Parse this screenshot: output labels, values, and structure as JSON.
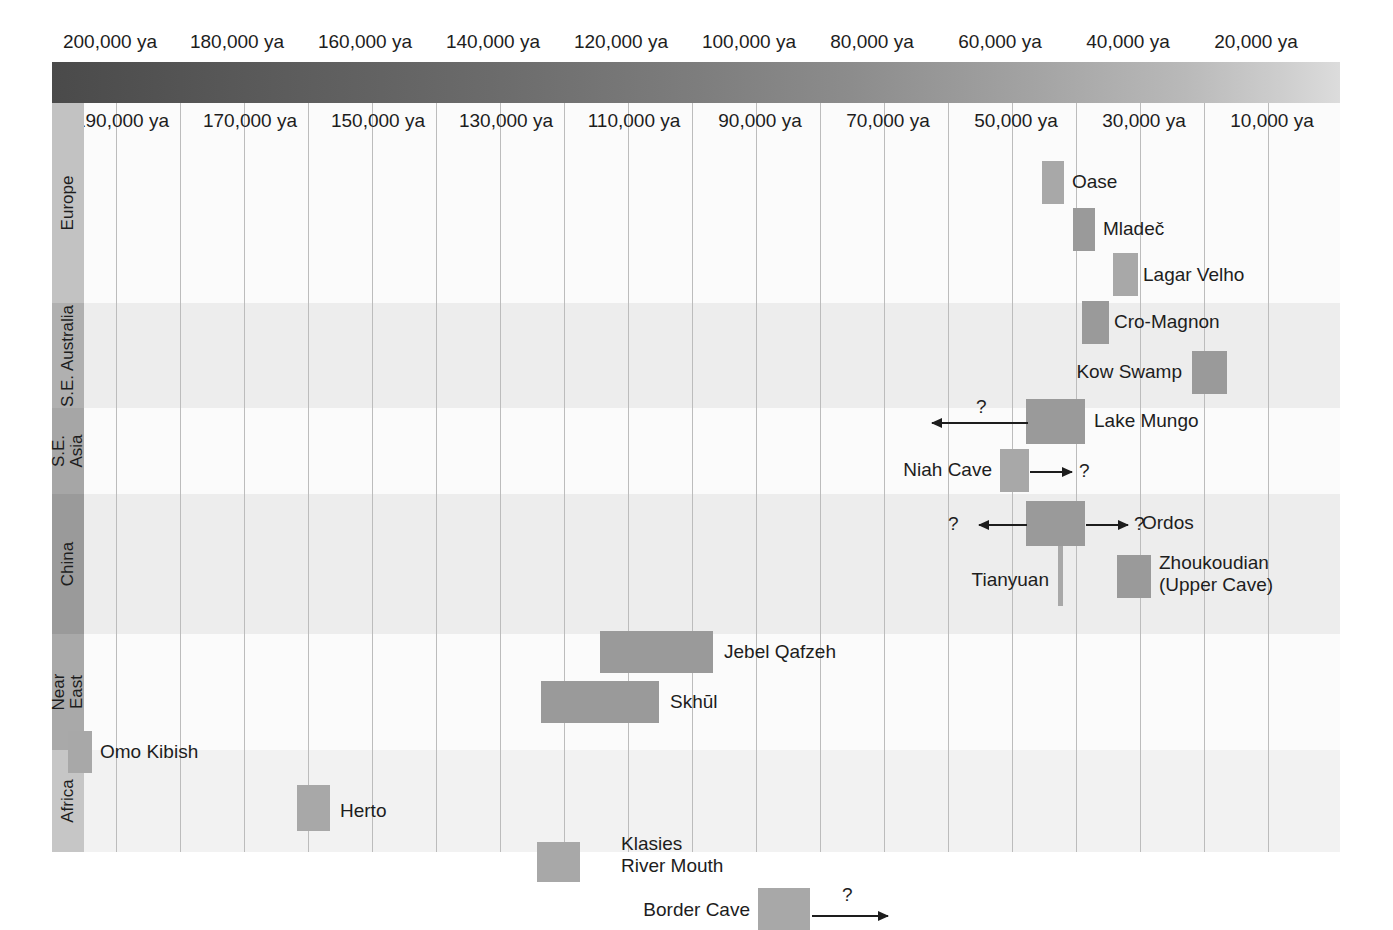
{
  "chart_data": {
    "type": "bar",
    "orientation": "horizontal-range",
    "xlabel": "Years ago",
    "ylabel": "Region",
    "xlim": [
      205000,
      0
    ],
    "x_axis_direction": "older-to-younger (left to right)",
    "grid": true,
    "legend": "none",
    "top_tick_labels": [
      {
        "label": "200,000 ya",
        "value": 200000
      },
      {
        "label": "180,000 ya",
        "value": 180000
      },
      {
        "label": "160,000 ya",
        "value": 160000
      },
      {
        "label": "140,000 ya",
        "value": 140000
      },
      {
        "label": "120,000 ya",
        "value": 120000
      },
      {
        "label": "100,000 ya",
        "value": 100000
      },
      {
        "label": "80,000 ya",
        "value": 80000
      },
      {
        "label": "60,000 ya",
        "value": 60000
      },
      {
        "label": "40,000 ya",
        "value": 40000
      },
      {
        "label": "20,000 ya",
        "value": 20000
      }
    ],
    "sub_tick_labels": [
      {
        "label": "190,000 ya",
        "value": 190000
      },
      {
        "label": "170,000 ya",
        "value": 170000
      },
      {
        "label": "150,000 ya",
        "value": 150000
      },
      {
        "label": "130,000 ya",
        "value": 130000
      },
      {
        "label": "110,000 ya",
        "value": 110000
      },
      {
        "label": "90,000 ya",
        "value": 90000
      },
      {
        "label": "70,000 ya",
        "value": 70000
      },
      {
        "label": "50,000 ya",
        "value": 50000
      },
      {
        "label": "30,000 ya",
        "value": 30000
      },
      {
        "label": "10,000 ya",
        "value": 10000
      }
    ],
    "gridline_values": [
      200000,
      190000,
      180000,
      170000,
      160000,
      150000,
      140000,
      130000,
      120000,
      110000,
      100000,
      90000,
      80000,
      70000,
      60000,
      50000,
      40000,
      30000,
      20000,
      10000
    ],
    "regions": [
      {
        "name": "Europe",
        "label": "Europe",
        "sites": [
          "Oase",
          "Mladeč",
          "Lagar Velho",
          "Cro-Magnon"
        ]
      },
      {
        "name": "SE Australia",
        "label": "S.E. Australia",
        "sites": [
          "Kow Swamp",
          "Lake Mungo"
        ]
      },
      {
        "name": "SE Asia",
        "label": "S.E. Asia",
        "sites": [
          "Niah Cave"
        ]
      },
      {
        "name": "China",
        "label": "China",
        "sites": [
          "Ordos",
          "Tianyuan",
          "Zhoukoudian (Upper Cave)"
        ]
      },
      {
        "name": "Near East",
        "label": "Near East",
        "sites": [
          "Jebel Qafzeh",
          "Skhūl"
        ]
      },
      {
        "name": "Africa",
        "label": "Africa",
        "sites": [
          "Omo Kibish",
          "Herto",
          "Klasies River Mouth",
          "Border Cave"
        ]
      }
    ],
    "sites": [
      {
        "name": "Oase",
        "region": "Europe",
        "start_ya": 41000,
        "end_ya": 37500,
        "label_side": "right",
        "uncertain": false
      },
      {
        "name": "Mladeč",
        "region": "Europe",
        "start_ya": 36500,
        "end_ya": 33500,
        "label_side": "right",
        "uncertain": false
      },
      {
        "name": "Lagar Velho",
        "region": "Europe",
        "start_ya": 30500,
        "end_ya": 27500,
        "label_side": "right",
        "uncertain": false
      },
      {
        "name": "Cro-Magnon",
        "region": "Europe",
        "start_ya": 33500,
        "end_ya": 30000,
        "label_side": "right",
        "uncertain": false
      },
      {
        "name": "Kow Swamp",
        "region": "SE Australia",
        "start_ya": 15500,
        "end_ya": 10500,
        "label_side": "left",
        "uncertain": false
      },
      {
        "name": "Lake Mungo",
        "region": "SE Australia",
        "start_ya": 43500,
        "end_ya": 34500,
        "label_side": "right",
        "uncertain": true,
        "arrow": "left",
        "arrow_qmark": "?"
      },
      {
        "name": "Niah Cave",
        "region": "SE Asia",
        "start_ya": 46000,
        "end_ya": 42000,
        "label_side": "left",
        "uncertain": true,
        "arrow": "right",
        "arrow_qmark": "?"
      },
      {
        "name": "Ordos",
        "region": "China",
        "start_ya": 43500,
        "end_ya": 34500,
        "label_side": "right",
        "uncertain": true,
        "arrow": "both",
        "arrow_qmark": "?"
      },
      {
        "name": "Tianyuan",
        "region": "China",
        "start_ya": 40500,
        "end_ya": 40000,
        "label_side": "left",
        "uncertain": false
      },
      {
        "name": "Zhoukoudian\n(Upper Cave)",
        "region": "China",
        "start_ya": 30500,
        "end_ya": 26500,
        "label_side": "right",
        "uncertain": false
      },
      {
        "name": "Jebel Qafzeh",
        "region": "Near East",
        "start_ya": 107000,
        "end_ya": 92000,
        "label_side": "right",
        "uncertain": false
      },
      {
        "name": "Skhūl",
        "region": "Near East",
        "start_ya": 113000,
        "end_ya": 99500,
        "label_side": "right",
        "uncertain": false
      },
      {
        "name": "Omo Kibish",
        "region": "Africa",
        "start_ya": 196500,
        "end_ya": 192500,
        "label_side": "right",
        "uncertain": false
      },
      {
        "name": "Herto",
        "region": "Africa",
        "start_ya": 160000,
        "end_ya": 155500,
        "label_side": "right",
        "uncertain": false
      },
      {
        "name": "Klasies River Mouth",
        "region": "Africa",
        "start_ya": 112000,
        "end_ya": 107500,
        "label_side": "right",
        "uncertain": false
      },
      {
        "name": "Border Cave",
        "region": "Africa",
        "start_ya": 85500,
        "end_ya": 79500,
        "label_side": "left",
        "uncertain": true,
        "arrow": "right",
        "arrow_qmark": "?"
      }
    ],
    "colors": {
      "bar": "#a8a8a8",
      "bar_dark": "#9a9a9a",
      "plot_background": "#f4f4f4",
      "gridline": "#bcbcbc",
      "text": "#1d1d1d",
      "band_start": "#4a4a4a",
      "band_end": "#dcdcdc"
    }
  },
  "axis": {
    "top": [
      {
        "label": "200,000 ya",
        "x": 110
      },
      {
        "label": "180,000 ya",
        "x": 237
      },
      {
        "label": "160,000 ya",
        "x": 365
      },
      {
        "label": "140,000 ya",
        "x": 493
      },
      {
        "label": "120,000 ya",
        "x": 621
      },
      {
        "label": "100,000 ya",
        "x": 749
      },
      {
        "label": "80,000 ya",
        "x": 872
      },
      {
        "label": "60,000 ya",
        "x": 1000
      },
      {
        "label": "40,000 ya",
        "x": 1128
      },
      {
        "label": "20,000 ya",
        "x": 1256
      }
    ],
    "sub": [
      {
        "label": "190,000 ya",
        "x": 122
      },
      {
        "label": "170,000 ya",
        "x": 250
      },
      {
        "label": "150,000 ya",
        "x": 378
      },
      {
        "label": "130,000 ya",
        "x": 506
      },
      {
        "label": "110,000 ya",
        "x": 634
      },
      {
        "label": "90,000 ya",
        "x": 760
      },
      {
        "label": "70,000 ya",
        "x": 888
      },
      {
        "label": "50,000 ya",
        "x": 1016
      },
      {
        "label": "30,000 ya",
        "x": 1144
      },
      {
        "label": "10,000 ya",
        "x": 1272
      }
    ]
  },
  "regions_gutter": [
    {
      "label": "Europe",
      "top": 0,
      "height": 200
    },
    {
      "label": "S.E. Australia",
      "top": 200,
      "height": 105
    },
    {
      "label": "S.E.\nAsia",
      "top": 305,
      "height": 86
    },
    {
      "label": "China",
      "top": 391,
      "height": 140
    },
    {
      "label": "Near\nEast",
      "top": 531,
      "height": 116
    },
    {
      "label": "Africa",
      "top": 647,
      "height": 102
    }
  ],
  "bars": [
    {
      "name": "Oase",
      "left": 1042,
      "top": 58,
      "width": 22,
      "height": 43,
      "shade": "bar",
      "label": "Oase",
      "label_x": 1072,
      "label_y": 68,
      "side": "right"
    },
    {
      "name": "Mladeč",
      "left": 1073,
      "top": 105,
      "width": 22,
      "height": 43,
      "shade": "bar_dark",
      "label": "Mladeč",
      "label_x": 1103,
      "label_y": 115,
      "side": "right"
    },
    {
      "name": "Lagar Velho",
      "left": 1113,
      "top": 150,
      "width": 25,
      "height": 43,
      "shade": "bar",
      "label": "Lagar Velho",
      "label_x": 1143,
      "label_y": 161,
      "side": "right"
    },
    {
      "name": "Cro-Magnon",
      "left": 1082,
      "top": 198,
      "width": 27,
      "height": 43,
      "shade": "bar_dark",
      "label": "Cro-Magnon",
      "label_x": 1114,
      "label_y": 208,
      "side": "right"
    },
    {
      "name": "Kow Swamp",
      "left": 1192,
      "top": 248,
      "width": 35,
      "height": 43,
      "shade": "bar_dark",
      "label": "Kow Swamp",
      "label_x": 1182,
      "label_y": 258,
      "side": "left"
    },
    {
      "name": "Lake Mungo",
      "left": 1026,
      "top": 296,
      "width": 59,
      "height": 45,
      "shade": "bar_dark",
      "label": "Lake Mungo",
      "label_x": 1094,
      "label_y": 307,
      "side": "right"
    },
    {
      "name": "Niah Cave",
      "left": 1000,
      "top": 346,
      "width": 29,
      "height": 43,
      "shade": "bar",
      "label": "Niah Cave",
      "label_x": 992,
      "label_y": 356,
      "side": "left"
    },
    {
      "name": "Ordos",
      "left": 1026,
      "top": 398,
      "width": 59,
      "height": 45,
      "shade": "bar_dark",
      "label": "Ordos",
      "label_x": 1142,
      "label_y": 409,
      "side": "right"
    },
    {
      "name": "Tianyuan",
      "left": 1058,
      "top": 443,
      "width": 5,
      "height": 60,
      "shade": "bar",
      "label": "Tianyuan",
      "label_x": 1049,
      "label_y": 466,
      "side": "left"
    },
    {
      "name": "Zhoukoudian",
      "left": 1117,
      "top": 452,
      "width": 34,
      "height": 43,
      "shade": "bar_dark",
      "label": "Zhoukoudian",
      "label_x": 1159,
      "label_y": 449,
      "side": "right",
      "label2": "(Upper Cave)",
      "label2_y": 471
    },
    {
      "name": "Jebel Qafzeh",
      "left": 600,
      "top": 528,
      "width": 113,
      "height": 42,
      "shade": "bar_dark",
      "label": "Jebel Qafzeh",
      "label_x": 724,
      "label_y": 538,
      "side": "right"
    },
    {
      "name": "Skhūl",
      "left": 541,
      "top": 578,
      "width": 118,
      "height": 42,
      "shade": "bar_dark",
      "label": "Skhūl",
      "label_x": 670,
      "label_y": 588,
      "side": "right"
    },
    {
      "name": "Omo Kibish",
      "left": 68,
      "top": 628,
      "width": 24,
      "height": 42,
      "shade": "bar",
      "label": "Omo Kibish",
      "label_x": 100,
      "label_y": 638,
      "side": "right"
    },
    {
      "name": "Herto",
      "left": 297,
      "top": 682,
      "width": 33,
      "height": 46,
      "shade": "bar",
      "label": "Herto",
      "label_x": 340,
      "label_y": 697,
      "side": "right"
    },
    {
      "name": "Klasies",
      "left": 537,
      "top": 739,
      "width": 43,
      "height": 40,
      "shade": "bar",
      "label": "Klasies",
      "label_x": 621,
      "label_y": 730,
      "side": "right",
      "label2": "River Mouth",
      "label2_y": 752
    },
    {
      "name": "Border Cave",
      "left": 758,
      "top": 785,
      "width": 52,
      "height": 42,
      "shade": "bar",
      "label": "Border Cave",
      "label_x": 750,
      "label_y": 796,
      "side": "left"
    }
  ],
  "arrows": [
    {
      "name": "lake-mungo-arrow",
      "dir": "left",
      "x": 932,
      "y": 319,
      "width": 96,
      "qmark": "?",
      "qx": 976,
      "qy": 294
    },
    {
      "name": "niah-cave-arrow",
      "dir": "right",
      "x": 1030,
      "y": 368,
      "width": 42,
      "qmark": "?",
      "qx": 1079,
      "qy": 358
    },
    {
      "name": "ordos-arrow-left",
      "dir": "left",
      "x": 979,
      "y": 421,
      "width": 48,
      "qmark": "?",
      "qx": 948,
      "qy": 411
    },
    {
      "name": "ordos-arrow-right",
      "dir": "right",
      "x": 1086,
      "y": 421,
      "width": 42,
      "qmark": "?",
      "qx": 1134,
      "qy": 411
    },
    {
      "name": "border-cave-arrow",
      "dir": "right",
      "x": 812,
      "y": 812,
      "width": 76,
      "qmark": "?",
      "qx": 842,
      "qy": 782
    }
  ],
  "ghost_text": {
    "line_a": "indicated as at Qafzeh and Skhūl.",
    "line_b": "the site and the artifacts found, the",
    "line_c": "between human ancestors and their"
  }
}
